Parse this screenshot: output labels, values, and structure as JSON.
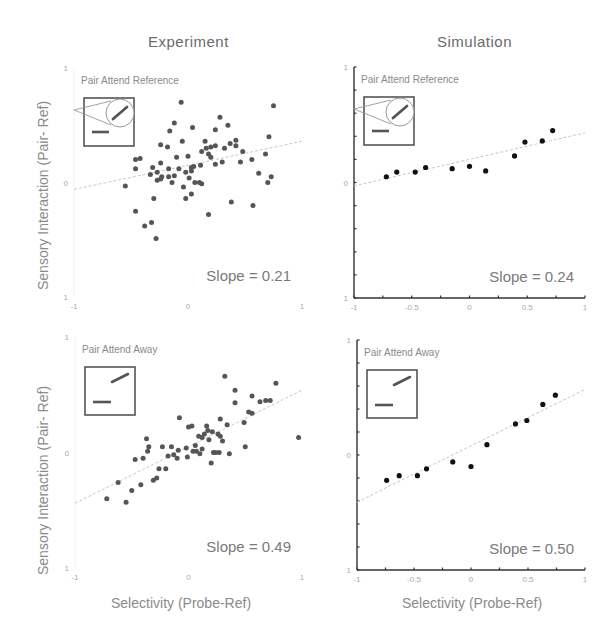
{
  "columns": {
    "left_title": "Experiment",
    "right_title": "Simulation"
  },
  "axes": {
    "ylabel": "Sensory Interaction (Pair- Ref)",
    "xlabel": "Selectivity (Probe-Ref)"
  },
  "colors": {
    "dot_experiment": "#555555",
    "dot_simulation": "#111111",
    "fit_line": "#c8c8c8",
    "axis": "#333333",
    "inset": "#555555"
  },
  "chart_data": [
    {
      "type": "scatter",
      "title": "Experiment",
      "panel_label": "Pair Attend Reference",
      "slope_label": "Slope = 0.21",
      "slope": 0.21,
      "xlabel": "",
      "ylabel": "Sensory Interaction (Pair- Ref)",
      "xlim": [
        -1,
        1
      ],
      "ylim": [
        -1,
        1
      ],
      "xticks": [
        "-1",
        "0",
        "1"
      ],
      "yticks": [
        "-1",
        "0",
        "1"
      ],
      "inset": "reference-zoom",
      "fit": {
        "x0": -1,
        "y0": -0.06,
        "x1": 1,
        "y1": 0.36
      },
      "points": [
        [
          -0.06,
          0.7
        ],
        [
          0.75,
          0.67
        ],
        [
          -0.12,
          0.52
        ],
        [
          -0.05,
          0.36
        ],
        [
          0.15,
          0.36
        ],
        [
          0.04,
          0.48
        ],
        [
          0.24,
          0.46
        ],
        [
          0.28,
          0.57
        ],
        [
          -0.16,
          0.45
        ],
        [
          0.35,
          0.5
        ],
        [
          0.71,
          0.4
        ],
        [
          -0.24,
          0.33
        ],
        [
          -0.18,
          0.31
        ],
        [
          0.0,
          0.23
        ],
        [
          0.12,
          0.27
        ],
        [
          0.18,
          0.25
        ],
        [
          0.2,
          0.31
        ],
        [
          0.24,
          0.32
        ],
        [
          0.32,
          0.3
        ],
        [
          0.42,
          0.32
        ],
        [
          0.42,
          0.37
        ],
        [
          0.48,
          0.27
        ],
        [
          0.37,
          0.34
        ],
        [
          0.56,
          0.2
        ],
        [
          0.68,
          0.25
        ],
        [
          -0.24,
          0.17
        ],
        [
          -0.1,
          0.22
        ],
        [
          -0.17,
          0.12
        ],
        [
          -0.08,
          0.12
        ],
        [
          0.03,
          0.13
        ],
        [
          0.11,
          0.15
        ],
        [
          0.24,
          0.16
        ],
        [
          0.3,
          0.18
        ],
        [
          0.46,
          0.18
        ],
        [
          -0.46,
          0.2
        ],
        [
          -0.42,
          0.21
        ],
        [
          -0.46,
          0.12
        ],
        [
          -0.27,
          0.09
        ],
        [
          -0.33,
          0.07
        ],
        [
          -0.24,
          0.03
        ],
        [
          -0.17,
          0.05
        ],
        [
          -0.12,
          0.06
        ],
        [
          -0.02,
          0.09
        ],
        [
          0.03,
          0.1
        ],
        [
          -0.27,
          0.02
        ],
        [
          -0.23,
          0.05
        ],
        [
          -0.14,
          0.0
        ],
        [
          -0.04,
          -0.04
        ],
        [
          0.06,
          0.0
        ],
        [
          0.1,
          0.0
        ],
        [
          0.12,
          -0.01
        ],
        [
          -0.55,
          -0.03
        ],
        [
          0.7,
          0.0
        ],
        [
          0.73,
          0.05
        ],
        [
          0.62,
          0.08
        ],
        [
          -0.3,
          -0.14
        ],
        [
          -0.02,
          -0.14
        ],
        [
          0.03,
          -0.1
        ],
        [
          0.38,
          -0.17
        ],
        [
          0.57,
          -0.2
        ],
        [
          -0.31,
          0.13
        ],
        [
          -0.46,
          -0.25
        ],
        [
          -0.32,
          -0.35
        ],
        [
          0.18,
          -0.28
        ],
        [
          -0.38,
          -0.38
        ],
        [
          -0.28,
          -0.49
        ],
        [
          0.2,
          0.22
        ],
        [
          0.16,
          0.3
        ],
        [
          0.05,
          0.14
        ],
        [
          0.01,
          0.04
        ]
      ]
    },
    {
      "type": "scatter",
      "title": "Simulation",
      "panel_label": "Pair Attend Reference",
      "slope_label": "Slope = 0.24",
      "slope": 0.24,
      "xlim": [
        -1,
        1
      ],
      "ylim": [
        -1,
        1
      ],
      "xticks": [
        "-1",
        "-0.5",
        "0",
        "0.5",
        "1"
      ],
      "yticks": [
        "-1",
        "0",
        "1"
      ],
      "inset": "reference-zoom",
      "fit": {
        "x0": -1,
        "y0": -0.03,
        "x1": 1,
        "y1": 0.43
      },
      "points": [
        [
          -0.72,
          0.05
        ],
        [
          -0.63,
          0.09
        ],
        [
          -0.47,
          0.09
        ],
        [
          -0.38,
          0.13
        ],
        [
          -0.15,
          0.12
        ],
        [
          0.0,
          0.14
        ],
        [
          0.14,
          0.1
        ],
        [
          0.39,
          0.23
        ],
        [
          0.48,
          0.35
        ],
        [
          0.63,
          0.36
        ],
        [
          0.72,
          0.45
        ]
      ]
    },
    {
      "type": "scatter",
      "title": "Experiment",
      "panel_label": "Pair Attend Away",
      "slope_label": "Slope = 0.49",
      "slope": 0.49,
      "xlabel": "Selectivity (Probe-Ref)",
      "ylabel": "Sensory Interaction (Pair- Ref)",
      "xlim": [
        -1,
        1
      ],
      "ylim": [
        -1,
        1
      ],
      "xticks": [
        "-1",
        "0",
        "1"
      ],
      "yticks": [
        "-1",
        "0",
        "1"
      ],
      "inset": "away",
      "fit": {
        "x0": -1,
        "y0": -0.44,
        "x1": 1,
        "y1": 0.54
      },
      "points": [
        [
          0.32,
          0.66
        ],
        [
          0.77,
          0.6
        ],
        [
          0.41,
          0.54
        ],
        [
          0.56,
          0.49
        ],
        [
          0.41,
          0.43
        ],
        [
          0.63,
          0.44
        ],
        [
          0.68,
          0.45
        ],
        [
          0.72,
          0.45
        ],
        [
          0.53,
          0.35
        ],
        [
          0.56,
          0.34
        ],
        [
          0.28,
          0.29
        ],
        [
          0.49,
          0.26
        ],
        [
          -0.08,
          0.3
        ],
        [
          0.03,
          0.23
        ],
        [
          0.0,
          0.22
        ],
        [
          0.16,
          0.23
        ],
        [
          0.17,
          0.19
        ],
        [
          0.21,
          0.18
        ],
        [
          0.26,
          0.16
        ],
        [
          0.28,
          0.14
        ],
        [
          0.09,
          0.14
        ],
        [
          0.14,
          0.16
        ],
        [
          0.34,
          0.24
        ],
        [
          0.12,
          0.13
        ],
        [
          -0.37,
          0.12
        ],
        [
          -0.35,
          0.05
        ],
        [
          0.97,
          0.13
        ],
        [
          -0.15,
          0.05
        ],
        [
          -0.09,
          0.02
        ],
        [
          -0.02,
          0.04
        ],
        [
          0.07,
          0.01
        ],
        [
          0.1,
          -0.01
        ],
        [
          0.12,
          0.03
        ],
        [
          0.22,
          0.0
        ],
        [
          0.24,
          0.0
        ],
        [
          0.27,
          0.0
        ],
        [
          0.36,
          -0.01
        ],
        [
          0.5,
          0.05
        ],
        [
          -0.23,
          0.05
        ],
        [
          -0.36,
          0.01
        ],
        [
          -0.18,
          -0.03
        ],
        [
          -0.13,
          -0.02
        ],
        [
          -0.1,
          -0.05
        ],
        [
          -0.01,
          -0.04
        ],
        [
          0.04,
          0.01
        ],
        [
          0.2,
          -0.09
        ],
        [
          -0.47,
          -0.06
        ],
        [
          -0.4,
          -0.05
        ],
        [
          -0.26,
          -0.14
        ],
        [
          -0.2,
          -0.14
        ],
        [
          -0.62,
          -0.26
        ],
        [
          -0.28,
          -0.22
        ],
        [
          -0.31,
          -0.24
        ],
        [
          -0.42,
          -0.28
        ],
        [
          -0.5,
          -0.33
        ],
        [
          -0.72,
          -0.4
        ],
        [
          -0.55,
          -0.43
        ],
        [
          0.06,
          0.06
        ],
        [
          0.18,
          0.11
        ],
        [
          0.3,
          0.1
        ]
      ]
    },
    {
      "type": "scatter",
      "title": "Simulation",
      "panel_label": "Pair Attend Away",
      "slope_label": "Slope = 0.50",
      "slope": 0.5,
      "xlabel": "Selectivity (Probe-Ref)",
      "xlim": [
        -1,
        1
      ],
      "ylim": [
        -1,
        1
      ],
      "xticks": [
        "-1",
        "-0.5",
        "0",
        "0.5",
        "1"
      ],
      "yticks": [
        "-1",
        "0",
        "1"
      ],
      "inset": "away",
      "fit": {
        "x0": -1,
        "y0": -0.41,
        "x1": 1,
        "y1": 0.57
      },
      "points": [
        [
          -0.74,
          -0.22
        ],
        [
          -0.63,
          -0.18
        ],
        [
          -0.47,
          -0.18
        ],
        [
          -0.39,
          -0.12
        ],
        [
          -0.16,
          -0.06
        ],
        [
          0.0,
          -0.1
        ],
        [
          0.14,
          0.09
        ],
        [
          0.39,
          0.27
        ],
        [
          0.49,
          0.3
        ],
        [
          0.63,
          0.44
        ],
        [
          0.74,
          0.52
        ]
      ]
    }
  ]
}
